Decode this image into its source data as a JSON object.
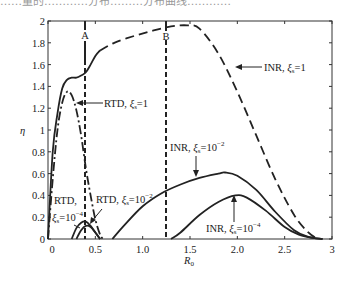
{
  "top_caption_fragment": "……量的…………分布………分布曲线…………",
  "chart_data": {
    "type": "line",
    "title": "",
    "xlabel": "R₀",
    "ylabel": "η",
    "xlim": [
      0,
      3
    ],
    "ylim": [
      0,
      2
    ],
    "xticks": [
      0,
      0.5,
      1.0,
      1.5,
      2.0,
      2.5,
      3
    ],
    "xtick_labels": [
      "0",
      "0.5",
      "1.0",
      "1.5",
      "2.0",
      "2.5",
      "3"
    ],
    "yticks": [
      0,
      0.2,
      0.4,
      0.6,
      0.8,
      1,
      1.2,
      1.4,
      1.6,
      1.8,
      2
    ],
    "ytick_labels": [
      "0",
      "0.2",
      "0.4",
      "0.6",
      "0.8",
      "1",
      "1.2",
      "1.4",
      "1.6",
      "1.8",
      "2"
    ],
    "grid": false,
    "legend": "none (inline annotations)",
    "vertical_markers": [
      {
        "label": "A",
        "x": 0.39,
        "style": "solid above curve, dashed below"
      },
      {
        "label": "B",
        "x": 1.25,
        "style": "solid above curve, dashed below"
      }
    ],
    "series": [
      {
        "name": "RTD, ξₛ=1",
        "style": "dash-dot",
        "region": "RTD",
        "x": [
          0.0,
          0.05,
          0.1,
          0.15,
          0.2,
          0.25,
          0.3,
          0.35,
          0.4,
          0.45,
          0.5,
          0.55,
          0.58
        ],
        "y": [
          0.0,
          0.55,
          1.0,
          1.25,
          1.35,
          1.32,
          1.18,
          0.95,
          0.65,
          0.4,
          0.18,
          0.04,
          0.0
        ]
      },
      {
        "name": "RTD, ξₛ=10⁻²",
        "style": "solid",
        "region": "RTD",
        "x": [
          0.25,
          0.3,
          0.35,
          0.4,
          0.45,
          0.5,
          0.55
        ],
        "y": [
          0.0,
          0.1,
          0.15,
          0.16,
          0.12,
          0.06,
          0.0
        ]
      },
      {
        "name": "RTD, ξₛ=10⁻⁴",
        "style": "solid",
        "region": "RTD",
        "x": [
          0.3,
          0.35,
          0.4,
          0.45,
          0.5,
          0.55
        ],
        "y": [
          0.0,
          0.08,
          0.12,
          0.11,
          0.06,
          0.0
        ]
      },
      {
        "name": "INR, ξₛ=1",
        "style": "solid (R₀<0.55) then dashed",
        "region": "INR",
        "x": [
          0.0,
          0.05,
          0.1,
          0.15,
          0.2,
          0.25,
          0.3,
          0.35,
          0.4,
          0.45,
          0.5,
          0.55,
          0.7,
          0.9,
          1.1,
          1.3,
          1.47,
          1.6,
          1.8,
          2.0,
          2.2,
          2.4,
          2.6,
          2.75,
          2.85
        ],
        "y": [
          0.0,
          0.8,
          1.15,
          1.38,
          1.46,
          1.48,
          1.48,
          1.5,
          1.53,
          1.6,
          1.68,
          1.73,
          1.8,
          1.86,
          1.91,
          1.95,
          1.96,
          1.93,
          1.7,
          1.35,
          0.95,
          0.55,
          0.22,
          0.06,
          0.0
        ]
      },
      {
        "name": "INR, ξₛ=10⁻²",
        "style": "solid",
        "region": "INR",
        "x": [
          0.68,
          0.8,
          1.0,
          1.2,
          1.4,
          1.6,
          1.8,
          1.87,
          2.0,
          2.2,
          2.4,
          2.6,
          2.75,
          2.9
        ],
        "y": [
          0.0,
          0.12,
          0.3,
          0.42,
          0.5,
          0.56,
          0.6,
          0.61,
          0.58,
          0.45,
          0.25,
          0.08,
          0.02,
          0.0
        ]
      },
      {
        "name": "INR, ξₛ=10⁻⁴",
        "style": "solid",
        "region": "INR",
        "x": [
          1.3,
          1.4,
          1.6,
          1.8,
          1.98,
          2.1,
          2.3,
          2.5,
          2.65,
          2.8,
          2.9
        ],
        "y": [
          0.0,
          0.06,
          0.22,
          0.34,
          0.4,
          0.38,
          0.26,
          0.11,
          0.04,
          0.01,
          0.0
        ]
      }
    ],
    "annotations": [
      {
        "text": "RTD, ξₛ=1",
        "target_series": 0
      },
      {
        "text": "RTD, ξₛ=10⁻²",
        "target_series": 1
      },
      {
        "text": "RTD, ξₛ=10⁻⁴",
        "target_series": 2
      },
      {
        "text": "INR, ξₛ=1",
        "target_series": 3
      },
      {
        "text": "INR, ξₛ=10⁻²",
        "target_series": 4
      },
      {
        "text": "INR, ξₛ=10⁻⁴",
        "target_series": 5
      }
    ]
  },
  "labels": {
    "marker_a": "A",
    "marker_b": "B",
    "ylabel": "η",
    "xlabel_main": "R",
    "xlabel_sub": "0",
    "rtd1_pre": "RTD, ",
    "rtd1_post": "=1",
    "rtd2_pre": "RTD, ",
    "rtd2_post": "=10",
    "rtd2_exp": "−2",
    "rtd4_line1": "RTD,",
    "rtd4_post": "=10",
    "rtd4_exp": "−4",
    "inr1_pre": "INR, ",
    "inr1_post": "=1",
    "inr2_pre": "INR, ",
    "inr2_post": "=10",
    "inr2_exp": "−2",
    "inr4_pre": "INR, ",
    "inr4_post": "=10",
    "inr4_exp": "−4",
    "xi": "ξ",
    "xi_sub": "s"
  }
}
